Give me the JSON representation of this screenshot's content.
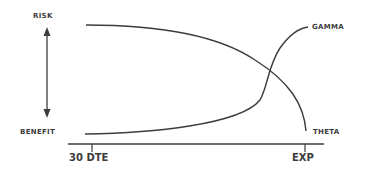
{
  "diagram": {
    "labels": {
      "risk": "Risk",
      "benefit": "Benefit",
      "gamma": "Gamma",
      "theta": "Theta"
    },
    "axis": {
      "start_tick": "30 DTE",
      "end_tick": "EXP"
    },
    "colors": {
      "stroke": "#3c3c3c",
      "text": "#3c3c3c",
      "background": "#ffffff"
    }
  }
}
